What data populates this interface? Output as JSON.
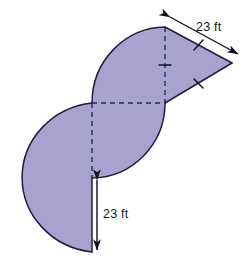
{
  "figure": {
    "fill_color": "#a7a2d0",
    "stroke_color": "#1f1f3d",
    "dashed_color": "#2a2a55",
    "background_color": "#ffffff",
    "shape_description": "S-shaped region: a left semicircle opening right, an upper quarter/half circle, and a triangle attached at the upper right",
    "dimensions": [
      {
        "id": "top_right_slant",
        "value": "23 ft",
        "number": 23,
        "unit": "ft",
        "orientation": "diagonal",
        "placement": "upper-right slanted edge of triangle",
        "arrow": "double-headed"
      },
      {
        "id": "bottom_vertical",
        "value": "23 ft",
        "number": 23,
        "unit": "ft",
        "orientation": "vertical",
        "placement": "lower vertical straight edge of left semicircle",
        "arrow": "double-headed"
      }
    ],
    "tick_marks": [
      {
        "id": "tick-upper-slant",
        "edge": "triangle upper slant"
      },
      {
        "id": "tick-lower-slant",
        "edge": "triangle lower slant"
      },
      {
        "id": "tick-vertical-dashed",
        "edge": "vertical dashed radius"
      }
    ],
    "construction_lines": [
      {
        "id": "vertical-dashed",
        "style": "dashed",
        "from": "top vertex",
        "to": "center"
      },
      {
        "id": "horizontal-dashed",
        "style": "dashed",
        "from": "left arc start",
        "to": "right center"
      },
      {
        "id": "vertical-dashed-lower",
        "style": "dashed",
        "from": "center",
        "to": "lower center"
      }
    ]
  }
}
